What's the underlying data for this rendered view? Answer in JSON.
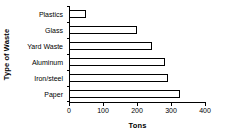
{
  "chart_data": {
    "type": "bar",
    "orientation": "horizontal",
    "title": "",
    "xlabel": "Tons",
    "ylabel": "Type of Waste",
    "categories": [
      "Plastics",
      "Glass",
      "Yard Waste",
      "Aluminum",
      "Iron/steel",
      "Paper"
    ],
    "values": [
      47,
      196,
      242,
      280,
      289,
      324
    ],
    "xlim": [
      0,
      400
    ],
    "xticks": [
      0,
      100,
      200,
      300,
      400
    ],
    "xtick_labels": [
      "0",
      "100",
      "200",
      "300",
      "400"
    ],
    "grid": false,
    "legend": null,
    "bar_fill_color": "#ffffff",
    "bar_border_color": "#000000",
    "axis_color": "#000000",
    "background_color": "#ffffff"
  }
}
